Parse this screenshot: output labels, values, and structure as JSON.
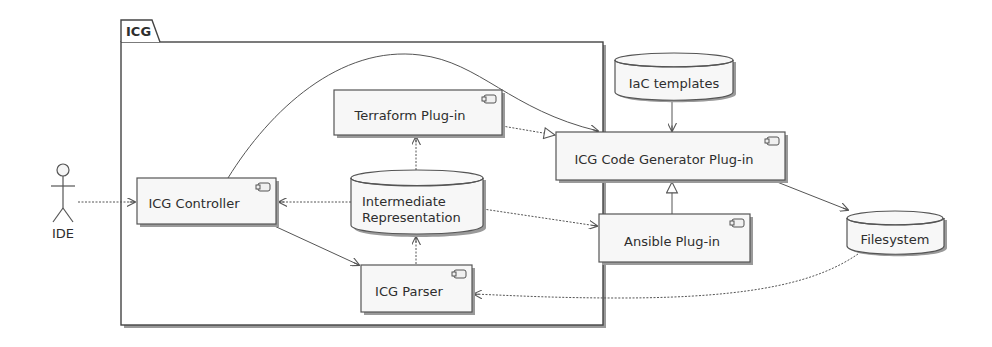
{
  "diagram": {
    "type": "uml-component",
    "package": {
      "label": "ICG"
    },
    "actor": {
      "id": "ide",
      "label": "IDE"
    },
    "components": [
      {
        "id": "controller",
        "label": "ICG Controller",
        "kind": "component"
      },
      {
        "id": "terraform",
        "label": "Terraform Plug-in",
        "kind": "component"
      },
      {
        "id": "parser",
        "label": "ICG Parser",
        "kind": "component"
      },
      {
        "id": "codegen",
        "label": "ICG Code Generator Plug-in",
        "kind": "component"
      },
      {
        "id": "ansible",
        "label": "Ansible Plug-in",
        "kind": "component"
      }
    ],
    "databases": [
      {
        "id": "ir",
        "label_line1": "Intermediate",
        "label_line2": "Representation"
      },
      {
        "id": "iac",
        "label": "IaC templates"
      },
      {
        "id": "fs",
        "label": "Filesystem"
      }
    ],
    "edges": [
      {
        "from": "ide",
        "to": "controller",
        "style": "dashed-arrow"
      },
      {
        "from": "ir",
        "to": "controller",
        "style": "dashed-arrow"
      },
      {
        "from": "controller",
        "to": "parser",
        "style": "arrow"
      },
      {
        "from": "controller",
        "to": "codegen",
        "style": "curved-arrow"
      },
      {
        "from": "parser",
        "to": "ir",
        "style": "dashed-arrow"
      },
      {
        "from": "ir",
        "to": "terraform",
        "style": "dashed-arrow"
      },
      {
        "from": "ir",
        "to": "ansible",
        "style": "dashed-arrow"
      },
      {
        "from": "terraform",
        "to": "codegen",
        "style": "realization"
      },
      {
        "from": "ansible",
        "to": "codegen",
        "style": "realization"
      },
      {
        "from": "iac",
        "to": "codegen",
        "style": "arrow"
      },
      {
        "from": "codegen",
        "to": "fs",
        "style": "arrow"
      },
      {
        "from": "fs",
        "to": "parser",
        "style": "curved-dashed-arrow"
      }
    ]
  },
  "colors": {
    "stroke": "#555555",
    "fill": "#f7f7f7",
    "shadow": "#9a9a9a",
    "text": "#2e2e2e"
  }
}
